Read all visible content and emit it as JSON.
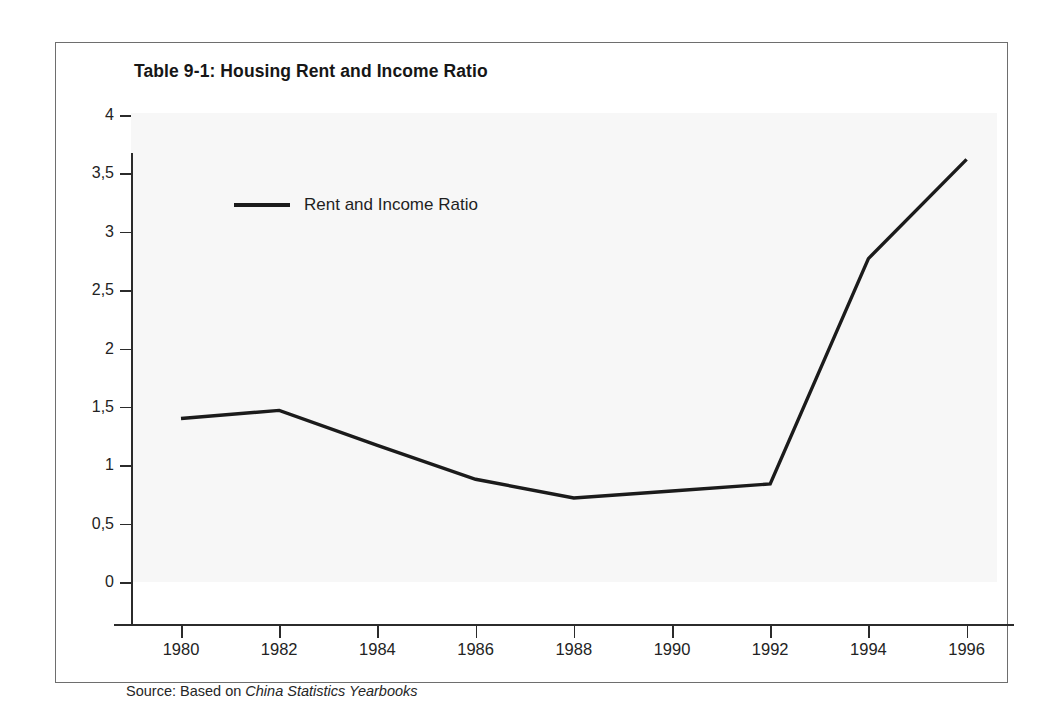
{
  "figure": {
    "title": "Table 9-1: Housing Rent and Income Ratio",
    "source_prefix": "Source: Based on ",
    "source_italic": "China Statistics Yearbooks"
  },
  "chart_data": {
    "type": "line",
    "title": "Table 9-1: Housing Rent and Income Ratio",
    "xlabel": "",
    "ylabel": "",
    "x": [
      1980,
      1982,
      1984,
      1986,
      1988,
      1990,
      1992,
      1994,
      1996
    ],
    "series": [
      {
        "name": "Rent and Income Ratio",
        "color": "#1b1b1b",
        "values": [
          1.4,
          1.47,
          1.17,
          0.88,
          0.72,
          0.78,
          0.84,
          2.77,
          3.62
        ]
      }
    ],
    "xlim": [
      1979,
      1997
    ],
    "ylim": [
      0,
      4
    ],
    "xticks": [
      1980,
      1982,
      1984,
      1986,
      1988,
      1990,
      1992,
      1994,
      1996
    ],
    "xticklabels": [
      "1980",
      "1982",
      "1984",
      "1986",
      "1988",
      "1990",
      "1992",
      "1994",
      "1996"
    ],
    "yticks": [
      0,
      0.5,
      1,
      1.5,
      2,
      2.5,
      3,
      3.5,
      4
    ],
    "yticklabels": [
      "0",
      "0,5",
      "1",
      "1,5",
      "2",
      "2,5",
      "3",
      "3,5",
      "4"
    ],
    "grid": false,
    "legend": [
      "Rent and Income Ratio"
    ],
    "legend_position": "upper left",
    "plot_background": "#f7f7f7",
    "axis_color": "#2b2b2b"
  }
}
